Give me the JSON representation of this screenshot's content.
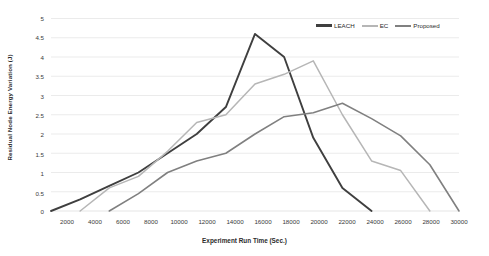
{
  "chart_data": {
    "type": "line",
    "title": "",
    "xlabel": "Experiment Run Time (Sec.)",
    "ylabel": "Residual Node Energy Variation (J)",
    "xlim": [
      2000,
      30000
    ],
    "ylim": [
      0,
      5
    ],
    "xticks": [
      2000,
      4000,
      6000,
      8000,
      10000,
      12000,
      14000,
      16000,
      18000,
      20000,
      22000,
      24000,
      26000,
      28000,
      30000
    ],
    "yticks": [
      0,
      0.5,
      1,
      1.5,
      2,
      2.5,
      3,
      3.5,
      4,
      4.5,
      5
    ],
    "grid": "horizontal",
    "legend_position": "top-right",
    "series": [
      {
        "name": "LEACH",
        "color": "#3f3f3f",
        "x": [
          2000,
          4000,
          6000,
          8000,
          10000,
          12000,
          14000,
          16000,
          18000,
          20000,
          22000,
          24000
        ],
        "values": [
          0,
          0.3,
          0.65,
          1.0,
          1.5,
          2.0,
          2.7,
          4.6,
          4.0,
          1.9,
          0.6,
          0
        ]
      },
      {
        "name": "EC",
        "color": "#b6b6b6",
        "x": [
          4000,
          6000,
          8000,
          10000,
          12000,
          14000,
          16000,
          18000,
          20000,
          22000,
          24000,
          26000,
          28000
        ],
        "values": [
          0,
          0.6,
          0.9,
          1.55,
          2.3,
          2.5,
          3.3,
          3.55,
          3.9,
          2.5,
          1.3,
          1.05,
          0
        ]
      },
      {
        "name": "Proposed",
        "color": "#808080",
        "x": [
          6000,
          8000,
          10000,
          12000,
          14000,
          16000,
          18000,
          20000,
          22000,
          24000,
          26000,
          28000,
          30000
        ],
        "values": [
          0,
          0.45,
          1.0,
          1.3,
          1.5,
          2.0,
          2.45,
          2.55,
          2.8,
          2.4,
          1.95,
          1.2,
          0
        ]
      }
    ]
  },
  "legend": {
    "items": [
      {
        "label": "LEACH",
        "color": "#3f3f3f"
      },
      {
        "label": "EC",
        "color": "#b6b6b6"
      },
      {
        "label": "Proposed",
        "color": "#808080"
      }
    ]
  },
  "axes": {
    "x_title": "Experiment Run Time (Sec.)",
    "y_title": "Residual Node Energy Variation (J)",
    "x_tick_labels": [
      "2000",
      "4000",
      "6000",
      "8000",
      "10000",
      "12000",
      "14000",
      "16000",
      "18000",
      "20000",
      "22000",
      "24000",
      "26000",
      "28000",
      "30000"
    ],
    "y_tick_labels": [
      "5",
      "4.5",
      "4",
      "3.5",
      "3",
      "2.5",
      "2",
      "1.5",
      "1",
      "0.5",
      "0"
    ]
  },
  "colors": {
    "background": "#ffffff",
    "gridline": "#e2e2e2",
    "text": "#2b2b2b"
  }
}
